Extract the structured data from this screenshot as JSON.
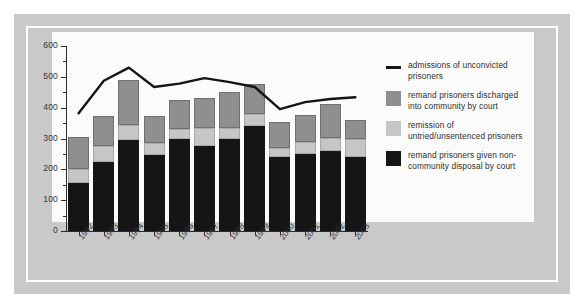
{
  "chart_data": {
    "type": "bar",
    "title": "",
    "subtitle": "",
    "xlabel": "",
    "ylabel": "",
    "ylim": [
      0,
      600
    ],
    "ytick_step": 100,
    "yminor_step": 50,
    "grid": false,
    "legend_position": "right",
    "stacked": true,
    "categories": [
      "1992",
      "1993",
      "1994",
      "1995",
      "1996",
      "1997",
      "1998",
      "1999",
      "2000",
      "2001",
      "2002",
      "2003"
    ],
    "ytick_labels": [
      "0",
      "100",
      "200",
      "300",
      "400",
      "500",
      "600"
    ],
    "series": [
      {
        "name": "remand prisoners given non-community disposal by court",
        "type": "bar",
        "color": "#151515",
        "values": [
          155,
          225,
          295,
          247,
          300,
          277,
          297,
          342,
          240,
          250,
          258,
          240
        ]
      },
      {
        "name": "remission of untried/unsentenced prisoners",
        "type": "bar",
        "color": "#c6c6c6",
        "values": [
          45,
          50,
          50,
          40,
          30,
          57,
          37,
          38,
          30,
          40,
          45,
          60
        ]
      },
      {
        "name": "remand prisoners discharged into community by court",
        "type": "bar",
        "color": "#8f8f8f",
        "values": [
          105,
          97,
          145,
          85,
          95,
          97,
          118,
          98,
          83,
          85,
          110,
          60
        ]
      },
      {
        "name": "admissions of unconvicted prisoners",
        "type": "line",
        "color": "#151515",
        "values": [
          382,
          487,
          530,
          467,
          478,
          496,
          483,
          467,
          395,
          418,
          428,
          434
        ]
      }
    ],
    "stack_totals": [
      305,
      372,
      490,
      372,
      425,
      431,
      452,
      478,
      353,
      375,
      413,
      360
    ]
  },
  "legend": {
    "items": [
      {
        "marker": "line",
        "label": "admissions of unconvicted prisoners"
      },
      {
        "marker": "swatch-mid-gray",
        "label": "remand prisoners discharged into community by court"
      },
      {
        "marker": "swatch-light-gray",
        "label": "remission of untried/unsentenced prisoners"
      },
      {
        "marker": "swatch-black",
        "label": "remand prisoners given non-community disposal by court"
      }
    ]
  },
  "colors": {
    "mount": "#c9c9c9",
    "canvas": "#fbfbfb",
    "axis": "#2b2b2b",
    "series_black": "#151515",
    "series_light_gray": "#c6c6c6",
    "series_mid_gray": "#8f8f8f"
  }
}
